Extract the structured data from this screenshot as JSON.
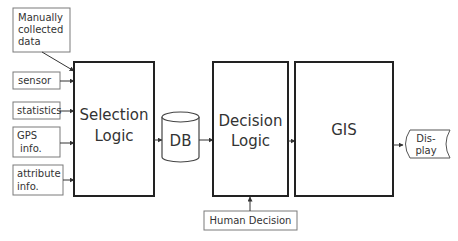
{
  "inputs": [
    {
      "lines": [
        "Manually",
        "collected",
        "data"
      ]
    },
    {
      "lines": [
        "sensor"
      ]
    },
    {
      "lines": [
        "statistics"
      ]
    },
    {
      "lines": [
        "GPS",
        "info."
      ]
    },
    {
      "lines": [
        "attribute",
        "info."
      ]
    }
  ],
  "selection_logic": {
    "lines": [
      "Selection",
      "Logic"
    ]
  },
  "db": {
    "label": "DB"
  },
  "decision_logic": {
    "lines": [
      "Decision",
      "Logic"
    ]
  },
  "gis": {
    "label": "GIS"
  },
  "display": {
    "lines": [
      "Dis-",
      "play"
    ]
  },
  "human_decision": {
    "label": "Human Decision"
  }
}
